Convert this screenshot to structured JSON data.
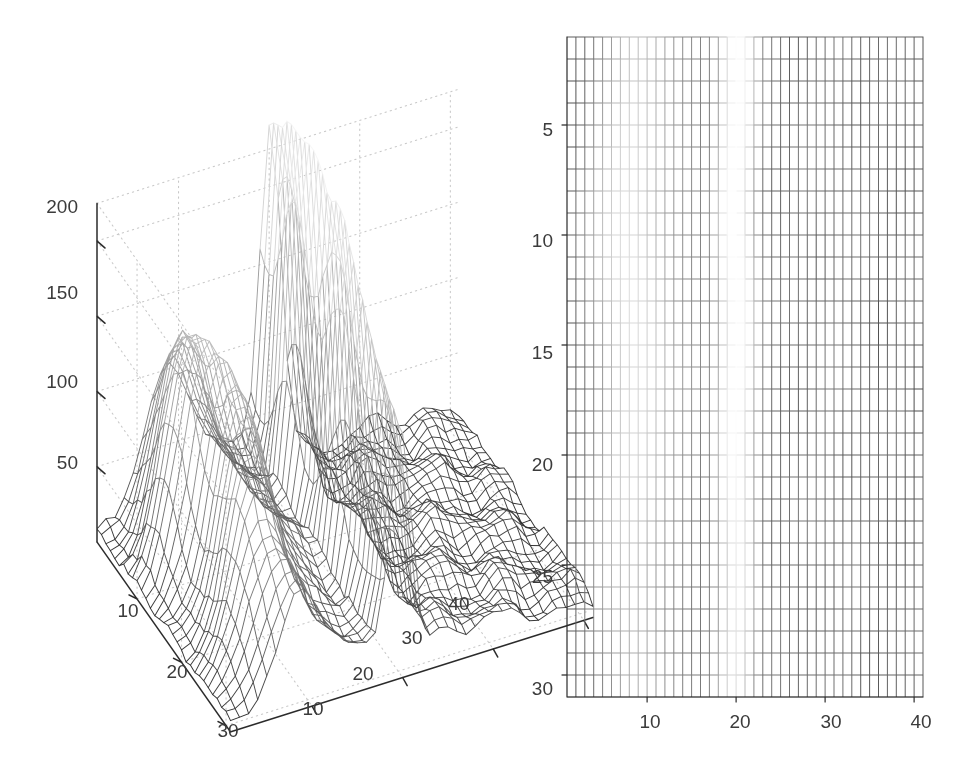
{
  "figure": {
    "background_color": "#ffffff",
    "line_color": "#1a1a1a",
    "grid_dotted_color": "#c8c8c8",
    "axis_color": "#2b2b2b",
    "label_color": "#3b3b3b",
    "panels": [
      "surface-3d",
      "mesh-2d-top-view"
    ]
  },
  "chart_data": [
    {
      "type": "surface",
      "id": "left-panel-3d-mesh",
      "title": "",
      "xlabel": "",
      "ylabel": "",
      "zlabel": "",
      "grid": true,
      "legend": null,
      "x_ticks": [
        10,
        20,
        30,
        40
      ],
      "y_ticks": [
        10,
        20,
        30
      ],
      "z_ticks": [
        50,
        100,
        150,
        200
      ],
      "xlim": [
        1,
        41
      ],
      "ylim": [
        1,
        31
      ],
      "zlim": [
        0,
        225
      ],
      "nx": 41,
      "ny": 31,
      "description": "Grayscale wireframe mesh surface with a tall narrow ridge near x=20 rising above 200, a secondary broad ridge near x=8 reaching about 170, and a low rippled plateau for x>24.",
      "peaks": [
        {
          "x": 20,
          "y": 4,
          "z": 225
        },
        {
          "x": 20,
          "y": 16,
          "z": 205
        },
        {
          "x": 8,
          "y": 10,
          "z": 170
        },
        {
          "x": 9,
          "y": 22,
          "z": 120
        }
      ],
      "ridge_x_main": 20,
      "ridge_x_secondary": 8,
      "plateau_level": 18
    },
    {
      "type": "heatmap",
      "id": "right-panel-2d-mesh",
      "title": "",
      "xlabel": "",
      "ylabel": "",
      "grid": true,
      "legend": null,
      "x_ticks": [
        10,
        20,
        30,
        40
      ],
      "y_ticks": [
        5,
        10,
        15,
        20,
        25,
        30
      ],
      "xlim": [
        1,
        41
      ],
      "ylim": [
        31,
        1
      ],
      "y_axis_inverted": true,
      "nx": 41,
      "ny": 31,
      "description": "Top-down view of the same mesh. Grid line darkness encodes height: lines fade to white over the high central/upper-left region (rows 9-20, columns 1-28) and are dark over the low-value border rows and the right-hand columns."
    }
  ],
  "left_panel": {
    "z_axis": {
      "ticks": [
        {
          "value": "200",
          "x": 78,
          "y": 206
        },
        {
          "value": "150",
          "x": 78,
          "y": 292
        },
        {
          "value": "100",
          "x": 78,
          "y": 381
        },
        {
          "value": "50",
          "x": 78,
          "y": 462
        }
      ]
    },
    "y_axis": {
      "ticks": [
        {
          "value": "10",
          "x": 128,
          "y": 610
        },
        {
          "value": "20",
          "x": 177,
          "y": 671
        },
        {
          "value": "30",
          "x": 228,
          "y": 730
        }
      ]
    },
    "x_axis": {
      "ticks": [
        {
          "value": "10",
          "x": 313,
          "y": 708
        },
        {
          "value": "20",
          "x": 363,
          "y": 673
        },
        {
          "value": "30",
          "x": 412,
          "y": 637
        },
        {
          "value": "40",
          "x": 459,
          "y": 603
        }
      ]
    }
  },
  "right_panel": {
    "y_axis": {
      "ticks": [
        {
          "value": "5",
          "x": 553,
          "y": 129
        },
        {
          "value": "10",
          "x": 553,
          "y": 240
        },
        {
          "value": "15",
          "x": 553,
          "y": 352
        },
        {
          "value": "20",
          "x": 553,
          "y": 464
        },
        {
          "value": "25",
          "x": 553,
          "y": 576
        },
        {
          "value": "30",
          "x": 553,
          "y": 688
        }
      ]
    },
    "x_axis": {
      "ticks": [
        {
          "value": "10",
          "x": 650,
          "y": 721
        },
        {
          "value": "20",
          "x": 740,
          "y": 721
        },
        {
          "value": "30",
          "x": 831,
          "y": 721
        },
        {
          "value": "40",
          "x": 921,
          "y": 721
        }
      ]
    }
  }
}
